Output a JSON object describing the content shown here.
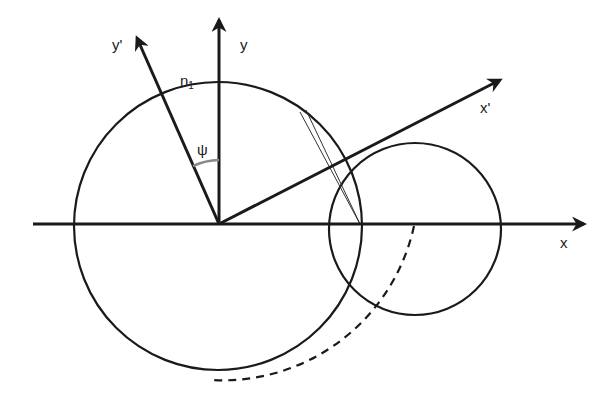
{
  "diagram": {
    "labels": {
      "x_axis": "x",
      "y_axis": "y",
      "x_prime": "x'",
      "y_prime": "y'",
      "n1_main": "n",
      "n1_sub": "1",
      "angle": "ψ"
    },
    "colors": {
      "line": "#1a1a1a",
      "angle_arc": "#888888",
      "background": "#ffffff"
    },
    "elements": [
      "x-axis arrow",
      "y-axis arrow",
      "x' rotated axis arrow",
      "y' rotated axis arrow",
      "large circle n1 centered at origin",
      "small circle centered on x-axis",
      "two thin chord lines",
      "dashed arc",
      "angle psi arc between y and y'"
    ]
  }
}
